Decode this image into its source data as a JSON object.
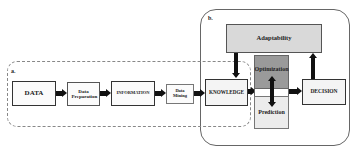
{
  "regions": {
    "a": {
      "label": "a."
    },
    "b": {
      "label": "b."
    }
  },
  "nodes": {
    "data": "DATA",
    "data_preparation": "Data Preparation",
    "information": "INFORMATION",
    "data_mining": "Data Mining",
    "knowledge": "KNOWLEDGE",
    "adaptability": "Adaptability",
    "optimization": "Optimization",
    "prediction": "Prediction",
    "decision": "DECISION"
  },
  "colors": {
    "adaptability_fill": "#d9d9d9",
    "optimization_fill": "#9a9a9a",
    "prediction_fill": "#ececec",
    "box_fill": "#fbfbfb",
    "arrow": "#111111"
  },
  "edges": [
    {
      "from": "DATA",
      "to": "Data Preparation"
    },
    {
      "from": "Data Preparation",
      "to": "INFORMATION"
    },
    {
      "from": "INFORMATION",
      "to": "Data Mining"
    },
    {
      "from": "Data Mining",
      "to": "KNOWLEDGE"
    },
    {
      "from": "Adaptability",
      "to": "KNOWLEDGE"
    },
    {
      "from": "KNOWLEDGE",
      "to": "Optimization/Prediction"
    },
    {
      "from": "Optimization",
      "to": "Prediction",
      "bidirectional": true
    },
    {
      "from": "Optimization/Prediction",
      "to": "DECISION"
    },
    {
      "from": "DECISION",
      "to": "Adaptability"
    }
  ]
}
